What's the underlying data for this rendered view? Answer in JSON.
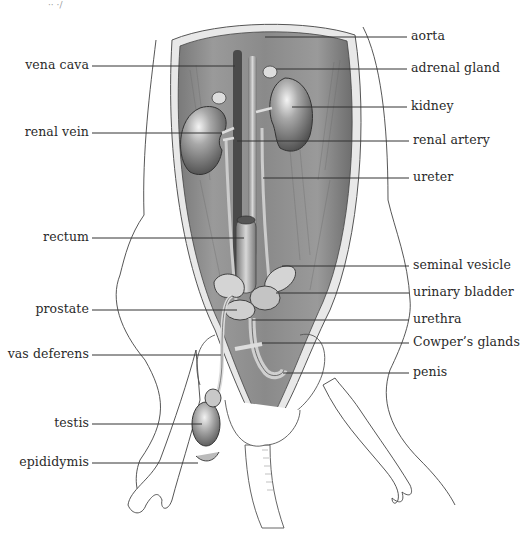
{
  "figure": {
    "corner_fragment": "·· ·/"
  },
  "labels_left": [
    {
      "id": "vena-cava",
      "text": "vena cava",
      "x_right": 89,
      "y": 66,
      "target_x": 235
    },
    {
      "id": "renal-vein",
      "text": "renal vein",
      "x_right": 89,
      "y": 133,
      "target_x": 222
    },
    {
      "id": "rectum",
      "text": "rectum",
      "x_right": 89,
      "y": 238,
      "target_x": 244
    },
    {
      "id": "prostate",
      "text": "prostate",
      "x_right": 89,
      "y": 310,
      "target_x": 237
    },
    {
      "id": "vas-deferens",
      "text": "vas deferens",
      "x_right": 89,
      "y": 355,
      "target_x": 221
    },
    {
      "id": "testis",
      "text": "testis",
      "x_right": 89,
      "y": 424,
      "target_x": 202
    },
    {
      "id": "epididymis",
      "text": "epididymis",
      "x_right": 89,
      "y": 463,
      "target_x": 198
    }
  ],
  "labels_right": [
    {
      "id": "aorta",
      "text": "aorta",
      "x_left": 411,
      "y": 37,
      "target_x": 265
    },
    {
      "id": "adrenal-gland",
      "text": "adrenal gland",
      "x_left": 411,
      "y": 69,
      "target_x": 276
    },
    {
      "id": "kidney",
      "text": "kidney",
      "x_left": 411,
      "y": 107,
      "target_x": 292
    },
    {
      "id": "renal-artery",
      "text": "renal artery",
      "x_left": 413,
      "y": 141,
      "target_x": 237
    },
    {
      "id": "ureter",
      "text": "ureter",
      "x_left": 413,
      "y": 178,
      "target_x": 263
    },
    {
      "id": "seminal-vesicle",
      "text": "seminal vesicle",
      "x_left": 413,
      "y": 266,
      "target_x": 282
    },
    {
      "id": "urinary-bladder",
      "text": "urinary bladder",
      "x_left": 413,
      "y": 293,
      "target_x": 276
    },
    {
      "id": "urethra",
      "text": "urethra",
      "x_left": 413,
      "y": 320,
      "target_x": 252
    },
    {
      "id": "cowpers-glands",
      "text": "Cowper’s glands",
      "x_left": 413,
      "y": 343,
      "target_x": 262
    },
    {
      "id": "penis",
      "text": "penis",
      "x_left": 413,
      "y": 373,
      "target_x": 283
    }
  ],
  "colors": {
    "ink": "#2a2a2a",
    "cavity_dark": "#5a5a5a",
    "cavity_mid": "#8c8c8c",
    "organ_light": "#cfcfcf",
    "organ_mid": "#9a9a9a",
    "skin": "#ffffff",
    "leader": "#333333"
  }
}
